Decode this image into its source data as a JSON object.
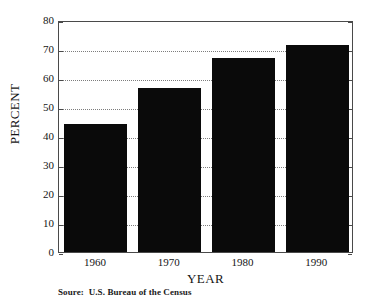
{
  "chart_data": {
    "type": "bar",
    "title": "",
    "subtitle": "",
    "xlabel": "YEAR",
    "ylabel": "PERCENT",
    "categories": [
      "1960",
      "1970",
      "1980",
      "1990"
    ],
    "values": [
      44,
      56.5,
      67,
      71.5
    ],
    "series": [
      {
        "name": "Percent",
        "values": [
          44,
          56.5,
          67,
          71.5
        ]
      }
    ],
    "ylim": [
      0,
      80
    ],
    "ytick_labels": [
      "80",
      "70",
      "60",
      "50",
      "40",
      "30",
      "20",
      "10",
      "0"
    ],
    "ytick_values": [
      80,
      70,
      60,
      50,
      40,
      30,
      20,
      10,
      0
    ],
    "xtick_labels": [
      "1960",
      "1970",
      "1980",
      "1990"
    ],
    "grid": "horizontal-dotted",
    "legend": "none",
    "bar_color": "#0a0a0a",
    "frame_color": "#4a4a4a",
    "grid_color": "#7d7d7d",
    "annotations": []
  },
  "caption": {
    "source_text": "Soure:  U.S. Bureau of the Census"
  }
}
